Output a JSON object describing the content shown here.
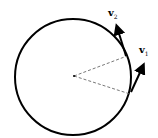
{
  "diagram": {
    "title": "",
    "circle": {
      "cx": 73,
      "cy": 77,
      "r": 58
    },
    "center_point": {
      "x": 74,
      "y": 76
    },
    "radii": [
      {
        "to_x": 127,
        "to_y": 56,
        "style": "dashed"
      },
      {
        "to_x": 130,
        "to_y": 94,
        "style": "dashed"
      }
    ],
    "vectors": [
      {
        "name": "v2",
        "label": "v",
        "subscript": "2",
        "from_x": 126,
        "from_y": 56,
        "to_x": 116,
        "to_y": 24
      },
      {
        "name": "v1",
        "label": "v",
        "subscript": "1",
        "from_x": 131,
        "from_y": 92,
        "to_x": 145,
        "to_y": 63
      }
    ],
    "colors": {
      "stroke": "#000000",
      "dashed": "#555555",
      "background": "#ffffff"
    }
  }
}
